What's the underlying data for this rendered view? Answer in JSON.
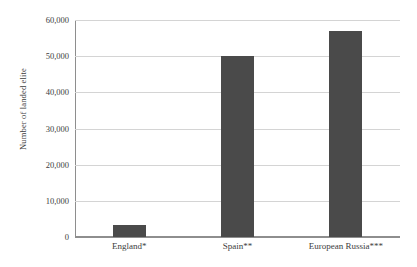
{
  "chart_data": {
    "type": "bar",
    "title": "",
    "xlabel": "",
    "ylabel": "Number of landed elite",
    "categories": [
      "England*",
      "Spain**",
      "European Russia***"
    ],
    "values": [
      3200,
      50000,
      57000
    ],
    "ylim": [
      0,
      60000
    ],
    "yticks": [
      0,
      10000,
      20000,
      30000,
      40000,
      50000,
      60000
    ],
    "ytick_labels": [
      "0",
      "10,000",
      "20,000",
      "30,000",
      "40,000",
      "50,000",
      "60,000"
    ],
    "grid": true,
    "legend": "none",
    "bar_color": "#4a4a4a",
    "grid_color": "#d4d4d4",
    "axis_color": "#8e8e8e",
    "background": "#ffffff"
  }
}
